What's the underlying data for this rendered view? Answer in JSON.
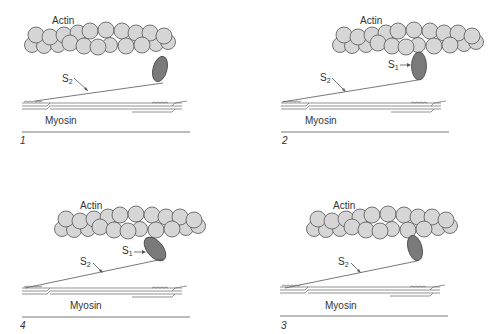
{
  "figure": {
    "panel_order_visual": [
      "1",
      "2",
      "4",
      "3"
    ],
    "colors": {
      "actin_bead_fill": "#d6d6d6",
      "actin_bead_stroke": "#555555",
      "s1_head_fill": "#7a7a7a",
      "line": "#555555",
      "background": "#ffffff"
    }
  },
  "panels": [
    {
      "number": "1",
      "position": "top-left",
      "actin_label": "Actin",
      "myosin_label": "Myosin",
      "s2_label": "S",
      "s2_sub": "2",
      "s1_label": null,
      "s1_state": "detached, angled"
    },
    {
      "number": "2",
      "position": "top-right",
      "actin_label": "Actin",
      "myosin_label": "Myosin",
      "s2_label": "S",
      "s2_sub": "2",
      "s1_label": "S",
      "s1_sub": "1",
      "s1_state": "attached, perpendicular"
    },
    {
      "number": "4",
      "position": "bottom-left",
      "actin_label": "Actin",
      "myosin_label": "Myosin",
      "s2_label": "S",
      "s2_sub": "2",
      "s1_label": "S",
      "s1_sub": "1",
      "s1_state": "attached, tilted (power stroke)"
    },
    {
      "number": "3",
      "position": "bottom-right",
      "actin_label": "Actin",
      "myosin_label": "Myosin",
      "s2_label": "S",
      "s2_sub": "2",
      "s1_label": null,
      "s1_state": "attached, angled"
    }
  ]
}
